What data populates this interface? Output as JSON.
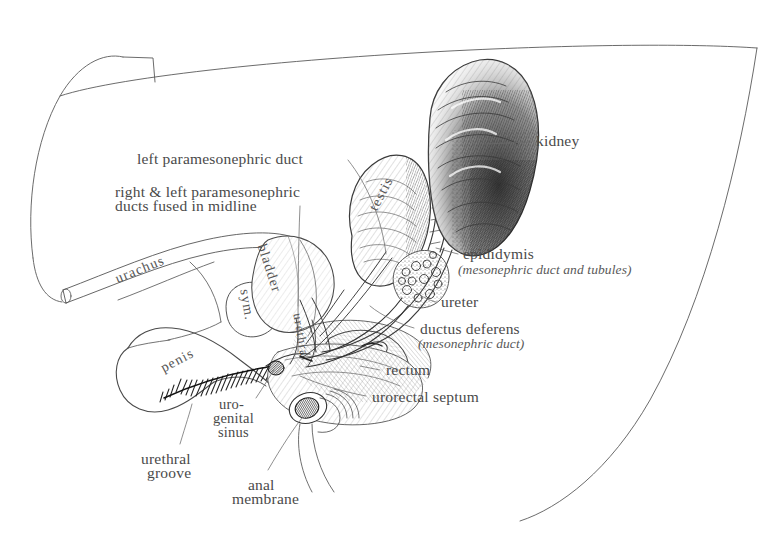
{
  "figure": {
    "background_color": "#ffffff",
    "ink_color": "#3a3a3a",
    "label_color": "#4a4a4a",
    "width": 760,
    "height": 533
  },
  "labels": {
    "left_paramesonephric_duct": "left paramesonephric duct",
    "fused_ducts_line1": "right & left paramesonephric",
    "fused_ducts_line2": "ducts fused in midline",
    "kidney": "kidney",
    "epididymis": "epididymis",
    "epididymis_sub": "(mesonephric duct and tubules)",
    "ureter": "ureter",
    "ductus_deferens": "ductus deferens",
    "ductus_deferens_sub": "(mesonephric duct)",
    "rectum": "rectum",
    "urorectal_septum": "urorectal septum",
    "urogenital_sinus_line1": "uro-",
    "urogenital_sinus_line2": "genital",
    "urogenital_sinus_line3": "sinus",
    "urethral_groove_line1": "urethral",
    "urethral_groove_line2": "groove",
    "anal_membrane_line1": "anal",
    "anal_membrane_line2": "membrane"
  },
  "inline_labels": {
    "urachus": "urachus",
    "bladder": "bladder",
    "sym": "sym.",
    "urethra": "urethra",
    "penis": "penis",
    "testis": "testis"
  }
}
